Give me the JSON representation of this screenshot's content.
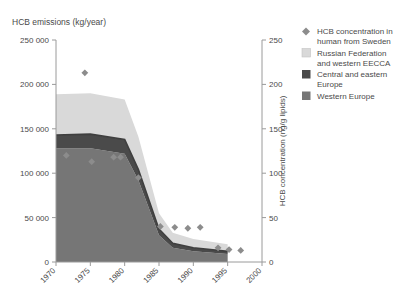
{
  "figure": {
    "left_axis_title": "HCB emissions (kg/year)",
    "right_axis_title": "HCB concentration (ng/g lipids)"
  },
  "legend": {
    "items": [
      {
        "key": "markers",
        "label_line1": "HCB concentration in",
        "label_line2": "human from Sweden",
        "color": "#8c8c8c",
        "swatch": "diamond"
      },
      {
        "key": "russia",
        "label_line1": "Russian Federation",
        "label_line2": "and western EECCA",
        "color": "#d9d9d9",
        "swatch": "square"
      },
      {
        "key": "central",
        "label_line1": "Central and eastern",
        "label_line2": "Europe",
        "color": "#4a4a4a",
        "swatch": "square"
      },
      {
        "key": "western",
        "label_line1": "Western Europe",
        "label_line2": "",
        "color": "#767676",
        "swatch": "square"
      }
    ]
  },
  "chart_data": {
    "type": "area",
    "title": "HCB emissions (kg/year)",
    "xlabel": "",
    "ylabel": "HCB emissions (kg/year)",
    "y2label": "HCB concentration (ng/g lipids)",
    "grid": false,
    "legend_position": "right",
    "xlim": [
      1970,
      2000
    ],
    "ylim": [
      0,
      250000
    ],
    "y2lim": [
      0,
      250
    ],
    "xticks": [
      1970,
      1975,
      1980,
      1985,
      1990,
      1995,
      2000
    ],
    "xticklabels": [
      "1970",
      "1975",
      "1980",
      "1985",
      "1990",
      "1995",
      "2000"
    ],
    "yticks": [
      0,
      50000,
      100000,
      150000,
      200000,
      250000
    ],
    "yticklabels": [
      "0",
      "50 000",
      "100 000",
      "150 000",
      "200 000",
      "250 000"
    ],
    "y2ticks": [
      0,
      50,
      100,
      150,
      200,
      250
    ],
    "y2ticklabels": [
      "0",
      "50",
      "100",
      "150",
      "200",
      "250"
    ],
    "x": [
      1970,
      1975,
      1980,
      1982,
      1985,
      1987,
      1990,
      1995
    ],
    "stacked_series": [
      {
        "name": "Western Europe",
        "color": "#767676",
        "values": [
          128000,
          128000,
          122000,
          92000,
          30000,
          16000,
          12000,
          9000
        ]
      },
      {
        "name": "Central and eastern Europe",
        "color": "#4a4a4a",
        "values": [
          15000,
          16000,
          16000,
          12000,
          7000,
          5000,
          4000,
          3000
        ]
      },
      {
        "name": "Russian Federation and western EECCA",
        "color": "#d9d9d9",
        "values": [
          46000,
          46000,
          45000,
          37000,
          18000,
          12000,
          10000,
          8000
        ]
      }
    ],
    "emphasis_line": {
      "name": "Western Europe + Central and eastern Europe",
      "color": "#3f3f3f",
      "x": [
        1970,
        1975,
        1980,
        1982,
        1985,
        1987,
        1990,
        1995
      ],
      "values": [
        143000,
        144000,
        138000,
        104000,
        37000,
        21000,
        16000,
        12000
      ]
    },
    "scatter_series": {
      "name": "HCB concentration in human from Sweden",
      "color": "#8c8c8c",
      "marker": "diamond",
      "axis": "y2",
      "points": [
        {
          "x": 1974.2,
          "y": 213
        },
        {
          "x": 1971.5,
          "y": 120
        },
        {
          "x": 1975.2,
          "y": 113
        },
        {
          "x": 1978.4,
          "y": 118
        },
        {
          "x": 1979.4,
          "y": 118
        },
        {
          "x": 1982.0,
          "y": 95
        },
        {
          "x": 1985.2,
          "y": 40
        },
        {
          "x": 1987.3,
          "y": 39
        },
        {
          "x": 1989.2,
          "y": 38
        },
        {
          "x": 1991.0,
          "y": 39
        },
        {
          "x": 1993.6,
          "y": 16
        },
        {
          "x": 1995.2,
          "y": 14
        },
        {
          "x": 1996.9,
          "y": 13
        }
      ]
    }
  }
}
